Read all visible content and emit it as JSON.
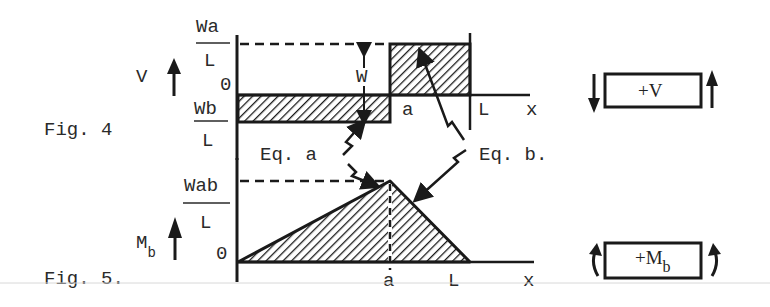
{
  "figures": [
    {
      "caption": "Fig. 4",
      "quantity": "V",
      "y_labels": {
        "top_fraction": {
          "numerator": "Wa",
          "denominator": "L"
        },
        "zero": "0",
        "bottom_fraction": {
          "numerator": "Wb",
          "denominator": "L"
        }
      },
      "x_labels": [
        "a",
        "L",
        "x"
      ],
      "jump_label": "W",
      "sign_convention": {
        "label": "+V"
      }
    },
    {
      "caption": "Fig. 5.",
      "quantity": "M",
      "quantity_sub": "b",
      "y_labels": {
        "peak_fraction": {
          "numerator": "Wab",
          "denominator": "L"
        },
        "zero": "0"
      },
      "x_labels": [
        "a",
        "L",
        "x"
      ],
      "sign_convention": {
        "label": "+M",
        "label_sub": "b"
      }
    }
  ],
  "annotations": {
    "eq_a": "Eq. a",
    "eq_b": "Eq. b."
  }
}
